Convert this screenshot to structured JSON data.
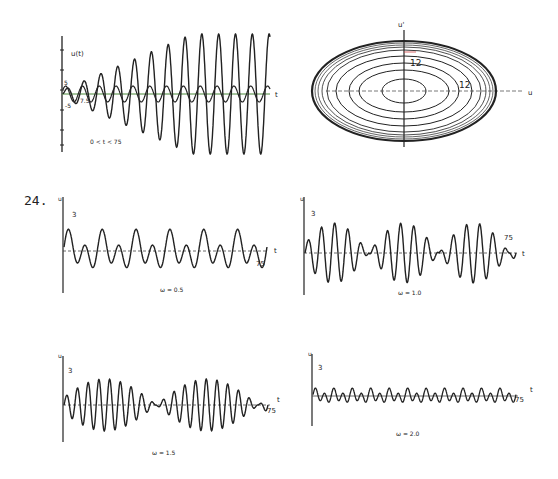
{
  "problem_number": "24.",
  "chart_data": [
    {
      "id": "top-left",
      "type": "line",
      "title": "",
      "ylabel": "u(t)",
      "xlabel": "t",
      "tick_labels": {
        "y_upper": "5",
        "y_lower": "-5",
        "x_mark": "7.5"
      },
      "annotation": "0 < t < 75",
      "xlim": [
        0,
        75
      ],
      "series": [
        {
          "name": "growing resonant response",
          "description": "amplitude grows linearly then saturates near ~25",
          "cycles": 12
        },
        {
          "name": "forcing (small amplitude)",
          "description": "steady sinusoid amplitude ~2.5",
          "cycles": 12
        }
      ]
    },
    {
      "id": "top-right",
      "type": "line",
      "title": "",
      "xlabel": "u",
      "ylabel": "u'",
      "annotation_labels": [
        "12",
        "12"
      ],
      "description": "phase-plane spiral of growing concentric ellipses"
    },
    {
      "id": "omega-0.5",
      "type": "line",
      "caption": "ω = 0.5",
      "ylabel": "u",
      "xlabel": "t",
      "tick_labels": {
        "y": "3",
        "x_end": "75"
      },
      "xlim": [
        0,
        75
      ]
    },
    {
      "id": "omega-1.0",
      "type": "line",
      "caption": "ω = 1.0",
      "ylabel": "u",
      "xlabel": "t",
      "tick_labels": {
        "y": "3",
        "x_end": "75"
      },
      "xlim": [
        0,
        75
      ]
    },
    {
      "id": "omega-1.5",
      "type": "line",
      "caption": "ω = 1.5",
      "ylabel": "u",
      "xlabel": "t",
      "tick_labels": {
        "y": "3",
        "x_end": "75"
      },
      "xlim": [
        0,
        75
      ]
    },
    {
      "id": "omega-2.0",
      "type": "line",
      "caption": "ω = 2.0",
      "ylabel": "u",
      "xlabel": "t",
      "tick_labels": {
        "y": "3",
        "x_end": "75"
      },
      "xlim": [
        0,
        75
      ]
    }
  ]
}
